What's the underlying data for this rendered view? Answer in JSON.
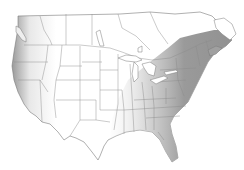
{
  "map": {
    "type": "range-map",
    "region": "North America (United States and southern Canada)",
    "shaded_area": "Eastern North America",
    "colors": {
      "background": "#ffffff",
      "land": "#ffffff",
      "borders": "#7a7a7a",
      "range_fill": "#9a9a9a",
      "range_fill_light": "#c8c8c8"
    },
    "labels": []
  }
}
